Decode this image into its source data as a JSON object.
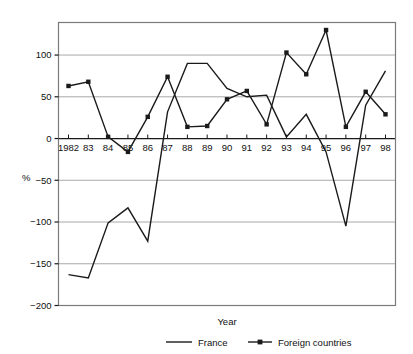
{
  "chart_data": {
    "type": "line",
    "title": "",
    "xlabel": "Year",
    "ylabel": "%",
    "categories": [
      "1982",
      "83",
      "84",
      "85",
      "86",
      "87",
      "88",
      "89",
      "90",
      "91",
      "92",
      "93",
      "94",
      "95",
      "96",
      "97",
      "98"
    ],
    "x_tick_labels": [
      "1982",
      "83",
      "84",
      "85",
      "86",
      "87",
      "88",
      "89",
      "90",
      "91",
      "92",
      "93",
      "94",
      "95",
      "96",
      "97",
      "98"
    ],
    "y_tick_labels": [
      "100",
      "50",
      "0",
      "−50",
      "−100",
      "−150",
      "−200"
    ],
    "y_tick_values": [
      100,
      50,
      0,
      -50,
      -100,
      -150,
      -200
    ],
    "ylim": [
      -200,
      139
    ],
    "xlim": [
      1981.5,
      1998.5
    ],
    "grid": "horizontal",
    "legend_position": "bottom",
    "series": [
      {
        "name": "France",
        "marker": "none",
        "color": "#1a1a1a",
        "values": [
          -163,
          -167,
          -101,
          -83,
          -123,
          32,
          90,
          90,
          60,
          50,
          52,
          2,
          29,
          -16,
          -105,
          40,
          81
        ]
      },
      {
        "name": "Foreign countries",
        "marker": "square",
        "color": "#1a1a1a",
        "values": [
          63,
          68,
          2,
          -16,
          26,
          74,
          14,
          15,
          47,
          57,
          17,
          103,
          77,
          130,
          14,
          56,
          29
        ]
      }
    ]
  },
  "legend": {
    "items": [
      {
        "label": "France",
        "marker": "line"
      },
      {
        "label": "Foreign countries",
        "marker": "line-with-markers"
      }
    ]
  },
  "axis": {
    "x_title": "Year",
    "y_title": "%"
  },
  "colors": {
    "line": "#1a1a1a",
    "grid": "#a9a9a9",
    "frame": "#7a7a7a",
    "text": "#111111",
    "background": "#ffffff"
  }
}
